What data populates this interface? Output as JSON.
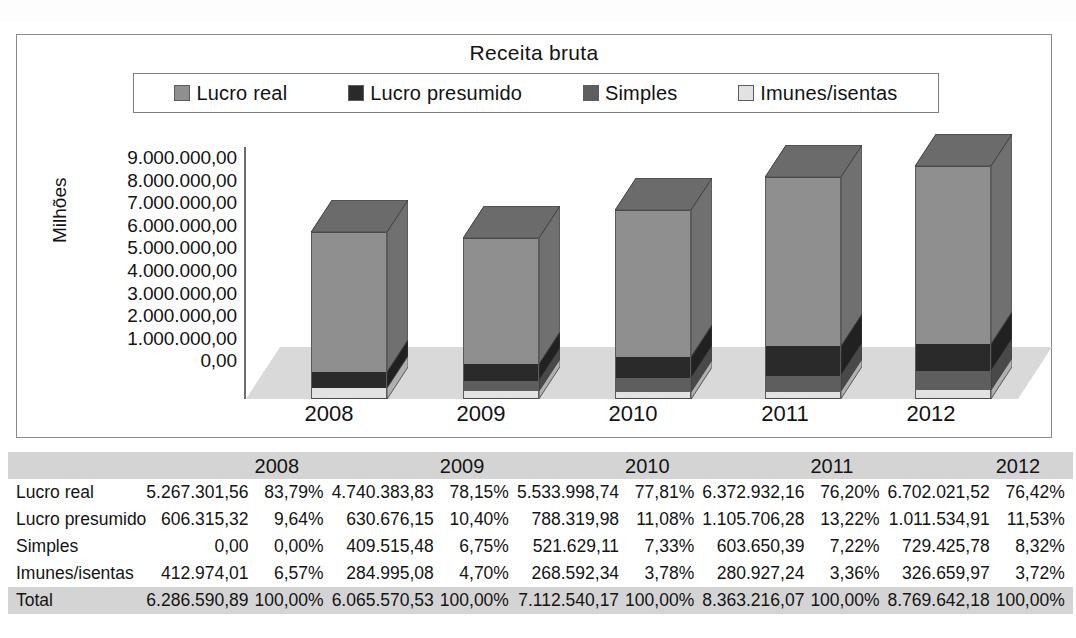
{
  "chart_data": {
    "type": "bar",
    "subtype": "stacked-3d-column",
    "title": "Receita bruta",
    "xlabel": "",
    "ylabel": "Milhões",
    "categories": [
      "2008",
      "2009",
      "2010",
      "2011",
      "2012"
    ],
    "y_tick_labels": [
      "9.000.000,00",
      "8.000.000,00",
      "7.000.000,00",
      "6.000.000,00",
      "5.000.000,00",
      "4.000.000,00",
      "3.000.000,00",
      "2.000.000,00",
      "1.000.000,00",
      "0,00"
    ],
    "ylim": [
      0,
      9000000
    ],
    "grid": false,
    "legend_position": "top",
    "series": [
      {
        "name": "Lucro real",
        "color": "#8f8f8f",
        "values": [
          5267301.56,
          4740383.83,
          5533998.74,
          6372932.16,
          6702021.52
        ],
        "percents": [
          "83,79%",
          "78,15%",
          "77,81%",
          "76,20%",
          "76,42%"
        ]
      },
      {
        "name": "Lucro presumido",
        "color": "#2a2a2a",
        "values": [
          606315.32,
          630676.15,
          788319.98,
          1105706.28,
          1011534.91
        ],
        "percents": [
          "9,64%",
          "10,40%",
          "11,08%",
          "13,22%",
          "11,53%"
        ]
      },
      {
        "name": "Simples",
        "color": "#5e5e5e",
        "values": [
          0.0,
          409515.48,
          521629.11,
          603650.39,
          729425.78
        ],
        "percents": [
          "0,00%",
          "6,75%",
          "7,33%",
          "7,22%",
          "8,32%"
        ]
      },
      {
        "name": "Imunes/isentas",
        "color": "#e2e2e2",
        "values": [
          412974.01,
          284995.08,
          268592.34,
          280927.24,
          326659.97
        ],
        "percents": [
          "6,57%",
          "4,70%",
          "3,78%",
          "3,36%",
          "3,72%"
        ]
      }
    ],
    "totals": [
      6286590.89,
      6065570.53,
      7112540.17,
      8363216.07,
      8769642.18
    ]
  },
  "chart": {
    "title": "Receita bruta",
    "y_axis_title": "Milhões",
    "legend": [
      {
        "label": "Lucro real",
        "color": "#8f8f8f"
      },
      {
        "label": "Lucro presumido",
        "color": "#2a2a2a"
      },
      {
        "label": "Simples",
        "color": "#5e5e5e"
      },
      {
        "label": "Imunes/isentas",
        "color": "#e2e2e2"
      }
    ],
    "y_ticks": [
      "9.000.000,00",
      "8.000.000,00",
      "7.000.000,00",
      "6.000.000,00",
      "5.000.000,00",
      "4.000.000,00",
      "3.000.000,00",
      "2.000.000,00",
      "1.000.000,00",
      "0,00"
    ],
    "x_labels": [
      "2008",
      "2009",
      "2010",
      "2011",
      "2012"
    ]
  },
  "table": {
    "corner_label": "",
    "year_headers": [
      "2008",
      "2009",
      "2010",
      "2011",
      "2012"
    ],
    "value_header": "",
    "pct_header": "",
    "rows": [
      {
        "label": "Lucro real",
        "cells": [
          {
            "value": "5.267.301,56",
            "pct": "83,79%"
          },
          {
            "value": "4.740.383,83",
            "pct": "78,15%"
          },
          {
            "value": "5.533.998,74",
            "pct": "77,81%"
          },
          {
            "value": "6.372.932,16",
            "pct": "76,20%"
          },
          {
            "value": "6.702.021,52",
            "pct": "76,42%"
          }
        ]
      },
      {
        "label": "Lucro presumido",
        "cells": [
          {
            "value": "606.315,32",
            "pct": "9,64%"
          },
          {
            "value": "630.676,15",
            "pct": "10,40%"
          },
          {
            "value": "788.319,98",
            "pct": "11,08%"
          },
          {
            "value": "1.105.706,28",
            "pct": "13,22%"
          },
          {
            "value": "1.011.534,91",
            "pct": "11,53%"
          }
        ]
      },
      {
        "label": "Simples",
        "cells": [
          {
            "value": "0,00",
            "pct": "0,00%"
          },
          {
            "value": "409.515,48",
            "pct": "6,75%"
          },
          {
            "value": "521.629,11",
            "pct": "7,33%"
          },
          {
            "value": "603.650,39",
            "pct": "7,22%"
          },
          {
            "value": "729.425,78",
            "pct": "8,32%"
          }
        ]
      },
      {
        "label": "Imunes/isentas",
        "cells": [
          {
            "value": "412.974,01",
            "pct": "6,57%"
          },
          {
            "value": "284.995,08",
            "pct": "4,70%"
          },
          {
            "value": "268.592,34",
            "pct": "3,78%"
          },
          {
            "value": "280.927,24",
            "pct": "3,36%"
          },
          {
            "value": "326.659,97",
            "pct": "3,72%"
          }
        ]
      },
      {
        "label": "Total",
        "is_total": true,
        "cells": [
          {
            "value": "6.286.590,89",
            "pct": "100,00%"
          },
          {
            "value": "6.065.570,53",
            "pct": "100,00%"
          },
          {
            "value": "7.112.540,17",
            "pct": "100,00%"
          },
          {
            "value": "8.363.216,07",
            "pct": "100,00%"
          },
          {
            "value": "8.769.642,18",
            "pct": "100,00%"
          }
        ]
      }
    ]
  },
  "colors": {
    "lucro_real": "#8f8f8f",
    "lucro_presumido": "#2a2a2a",
    "simples": "#5e5e5e",
    "imunes_isentas": "#e2e2e2",
    "floor": "#d8d8d8",
    "table_header_bg": "#d4d4d4",
    "frame_border": "#8a8a8a"
  }
}
